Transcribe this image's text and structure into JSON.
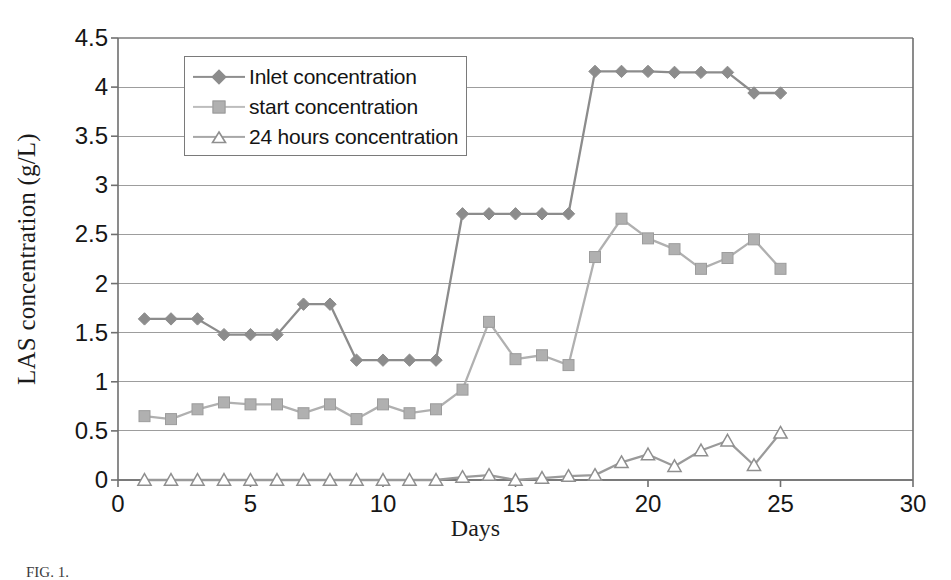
{
  "chart_data": {
    "type": "line",
    "title": "",
    "xlabel": "Days",
    "ylabel": "LAS concentration (g/L)",
    "xlim": [
      0,
      30
    ],
    "ylim": [
      0,
      4.5
    ],
    "xticks": [
      "0",
      "5",
      "10",
      "15",
      "20",
      "25",
      "30"
    ],
    "xtick_values": [
      0,
      5,
      10,
      15,
      20,
      25,
      30
    ],
    "yticks": [
      "0",
      "0.5",
      "1",
      "1.5",
      "2",
      "2.5",
      "3",
      "3.5",
      "4",
      "4.5"
    ],
    "ytick_values": [
      0,
      0.5,
      1,
      1.5,
      2,
      2.5,
      3,
      3.5,
      4,
      4.5
    ],
    "grid": "horizontal",
    "legend_position": "upper-left-inside",
    "x": [
      1,
      2,
      3,
      4,
      5,
      6,
      7,
      8,
      9,
      10,
      11,
      12,
      13,
      14,
      15,
      16,
      17,
      18,
      19,
      20,
      21,
      22,
      23,
      24,
      25
    ],
    "series": [
      {
        "name": "Inlet concentration",
        "marker": "diamond",
        "color": "#8c8c8c",
        "values": [
          1.64,
          1.64,
          1.64,
          1.48,
          1.48,
          1.48,
          1.79,
          1.79,
          1.22,
          1.22,
          1.22,
          1.22,
          2.71,
          2.71,
          2.71,
          2.71,
          2.71,
          4.16,
          4.16,
          4.16,
          4.15,
          4.15,
          4.15,
          3.94,
          3.94
        ]
      },
      {
        "name": "start concentration",
        "marker": "square",
        "color": "#b0b0b0",
        "values": [
          0.65,
          0.62,
          0.72,
          0.79,
          0.77,
          0.77,
          0.68,
          0.77,
          0.62,
          0.77,
          0.68,
          0.72,
          0.92,
          1.61,
          1.23,
          1.27,
          1.17,
          2.27,
          2.66,
          2.46,
          2.35,
          2.15,
          2.26,
          2.45,
          2.15
        ]
      },
      {
        "name": "24 hours concentration",
        "marker": "triangle-open",
        "color": "#9a9a9a",
        "values": [
          0.0,
          0.0,
          0.0,
          0.0,
          0.0,
          0.0,
          0.0,
          0.0,
          0.0,
          0.0,
          0.0,
          0.0,
          0.03,
          0.05,
          0.0,
          0.02,
          0.04,
          0.05,
          0.18,
          0.26,
          0.14,
          0.3,
          0.4,
          0.15,
          0.48
        ]
      }
    ]
  },
  "legend": {
    "items": [
      {
        "label": "Inlet concentration",
        "marker": "diamond"
      },
      {
        "label": "start concentration",
        "marker": "square"
      },
      {
        "label": "24 hours concentration",
        "marker": "triangle-open"
      }
    ]
  },
  "caption": {
    "text": "FIG. 1."
  },
  "colors": {
    "inlet": "#8c8c8c",
    "start": "#b0b0b0",
    "hours24": "#9a9a9a",
    "grid": "#9d9d9d",
    "axis": "#6f6f6f",
    "text": "#161616"
  }
}
